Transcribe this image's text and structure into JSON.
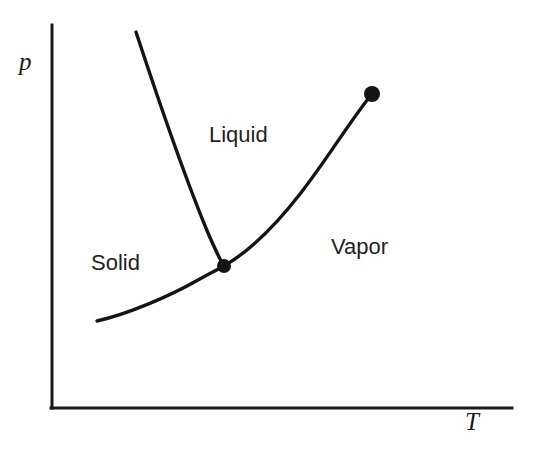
{
  "figure": {
    "kind": "phase-diagram",
    "background_color": "#ffffff",
    "ink_color": "#1a1a1a"
  },
  "axes": {
    "y": {
      "label": "p",
      "name": "pressure",
      "x_px": 52,
      "top_px": 25,
      "bottom_px": 408
    },
    "x": {
      "label": "T",
      "name": "temperature",
      "y_px": 408,
      "left_px": 52,
      "right_px": 512
    },
    "line_color": "#1a1a1a",
    "line_width": 3,
    "ticks": [],
    "grid": false
  },
  "regions": [
    {
      "id": "solid",
      "label": "Solid",
      "x_px": 120,
      "y_px": 263
    },
    {
      "id": "liquid",
      "label": "Liquid",
      "x_px": 240,
      "y_px": 135
    },
    {
      "id": "vapor",
      "label": "Vapor",
      "x_px": 362,
      "y_px": 247
    }
  ],
  "points": [
    {
      "id": "triple-point",
      "x_px": 224,
      "y_px": 266,
      "radius_px": 7,
      "filled": true,
      "color": "#141414"
    },
    {
      "id": "critical-point",
      "x_px": 372,
      "y_px": 94,
      "radius_px": 8,
      "filled": true,
      "color": "#141414"
    }
  ],
  "chart_data": {
    "type": "line",
    "title": "",
    "xlabel": "T",
    "ylabel": "p",
    "grid": false,
    "legend": "none",
    "xlim_px": [
      52,
      512
    ],
    "ylim_px": [
      408,
      25
    ],
    "annotations": [
      {
        "text": "Solid",
        "x_px": 120,
        "y_px": 263
      },
      {
        "text": "Liquid",
        "x_px": 240,
        "y_px": 135
      },
      {
        "text": "Vapor",
        "x_px": 362,
        "y_px": 247
      }
    ],
    "markers": [
      {
        "name": "triple point",
        "x_px": 224,
        "y_px": 266
      },
      {
        "name": "critical point",
        "x_px": 372,
        "y_px": 94
      }
    ],
    "series": [
      {
        "name": "fusion-curve",
        "description": "solid-liquid coexistence line, steep, slightly concave toward higher T",
        "path": "M 136 32 C 160 105, 188 185, 208 233 C 215 249, 220 260, 224 266",
        "points_px": [
          [
            136,
            32
          ],
          [
            158,
            100
          ],
          [
            178,
            160
          ],
          [
            196,
            210
          ],
          [
            212,
            248
          ],
          [
            224,
            266
          ]
        ]
      },
      {
        "name": "sublimation-curve",
        "description": "solid-vapor coexistence line, rising concave up from left to triple point",
        "path": "M 97 321 C 128 314, 170 296, 198 280 C 210 273, 219 269, 224 266",
        "points_px": [
          [
            97,
            321
          ],
          [
            125,
            314
          ],
          [
            150,
            305
          ],
          [
            175,
            293
          ],
          [
            200,
            279
          ],
          [
            224,
            266
          ]
        ]
      },
      {
        "name": "vaporization-curve",
        "description": "liquid-vapor coexistence line from triple point up to critical point",
        "path": "M 224 266 C 248 252, 272 230, 300 194 C 328 158, 352 118, 372 94",
        "points_px": [
          [
            224,
            266
          ],
          [
            250,
            250
          ],
          [
            276,
            226
          ],
          [
            302,
            192
          ],
          [
            330,
            156
          ],
          [
            352,
            124
          ],
          [
            372,
            94
          ]
        ]
      }
    ]
  }
}
